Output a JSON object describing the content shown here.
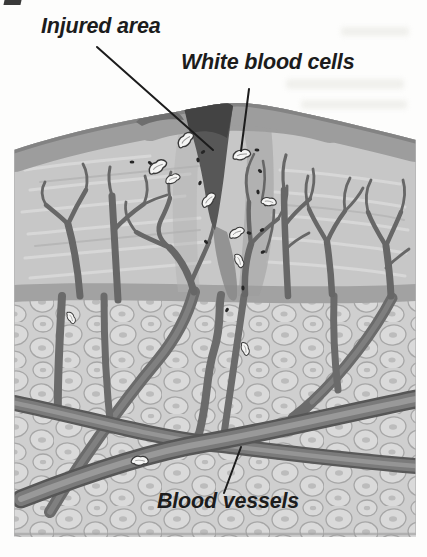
{
  "labels": {
    "injured_area": "Injured area",
    "white_blood_cells": "White blood cells",
    "blood_vessels": "Blood vessels"
  },
  "figure": {
    "leader_lines": {
      "injured_area": {
        "x1": 97,
        "y1": 47,
        "x2": 213,
        "y2": 150
      },
      "white_blood_cells": {
        "x1": 249,
        "y1": 89,
        "x2": 241,
        "y2": 151
      },
      "blood_vessels": {
        "x1": 241,
        "y1": 447,
        "x2": 224,
        "y2": 493
      }
    },
    "colors": {
      "ink": "#1c1c1c",
      "paper": "#fdfdfc",
      "epidermis": "#9d9d9d",
      "dermis": "#c7c7c7",
      "fat_background": "#cfcfcf",
      "fat_cell": "#dadada",
      "vessel": "#676767",
      "vessel_large_core": "#979797",
      "wound": "#575757",
      "scab": "#434343",
      "white_blood_cell": "#f5f5f4",
      "bacteria": "#262626"
    },
    "white_blood_cells": [
      {
        "x": 186,
        "y": 140,
        "r": -35,
        "s": 1.05
      },
      {
        "x": 158,
        "y": 167,
        "r": -25,
        "s": 1.1
      },
      {
        "x": 173,
        "y": 179,
        "r": -15,
        "s": 0.85
      },
      {
        "x": 242,
        "y": 155,
        "r": -5,
        "s": 1.0
      },
      {
        "x": 209,
        "y": 200,
        "r": -40,
        "s": 0.95
      },
      {
        "x": 269,
        "y": 202,
        "r": 15,
        "s": 0.85
      },
      {
        "x": 237,
        "y": 233,
        "r": -20,
        "s": 0.9
      },
      {
        "x": 239,
        "y": 261,
        "r": 75,
        "s": 0.8
      },
      {
        "x": 71,
        "y": 318,
        "r": 70,
        "s": 0.7
      },
      {
        "x": 245,
        "y": 349,
        "r": 80,
        "s": 0.75
      },
      {
        "x": 140,
        "y": 461,
        "r": 8,
        "s": 0.95
      }
    ],
    "bacteria": [
      {
        "x": 132,
        "y": 162
      },
      {
        "x": 150,
        "y": 163
      },
      {
        "x": 198,
        "y": 160
      },
      {
        "x": 200,
        "y": 183
      },
      {
        "x": 203,
        "y": 152
      },
      {
        "x": 257,
        "y": 150
      },
      {
        "x": 260,
        "y": 171
      },
      {
        "x": 258,
        "y": 192
      },
      {
        "x": 266,
        "y": 204
      },
      {
        "x": 262,
        "y": 230
      },
      {
        "x": 249,
        "y": 233
      },
      {
        "x": 206,
        "y": 242
      },
      {
        "x": 243,
        "y": 288
      },
      {
        "x": 227,
        "y": 310
      },
      {
        "x": 263,
        "y": 252
      }
    ]
  }
}
